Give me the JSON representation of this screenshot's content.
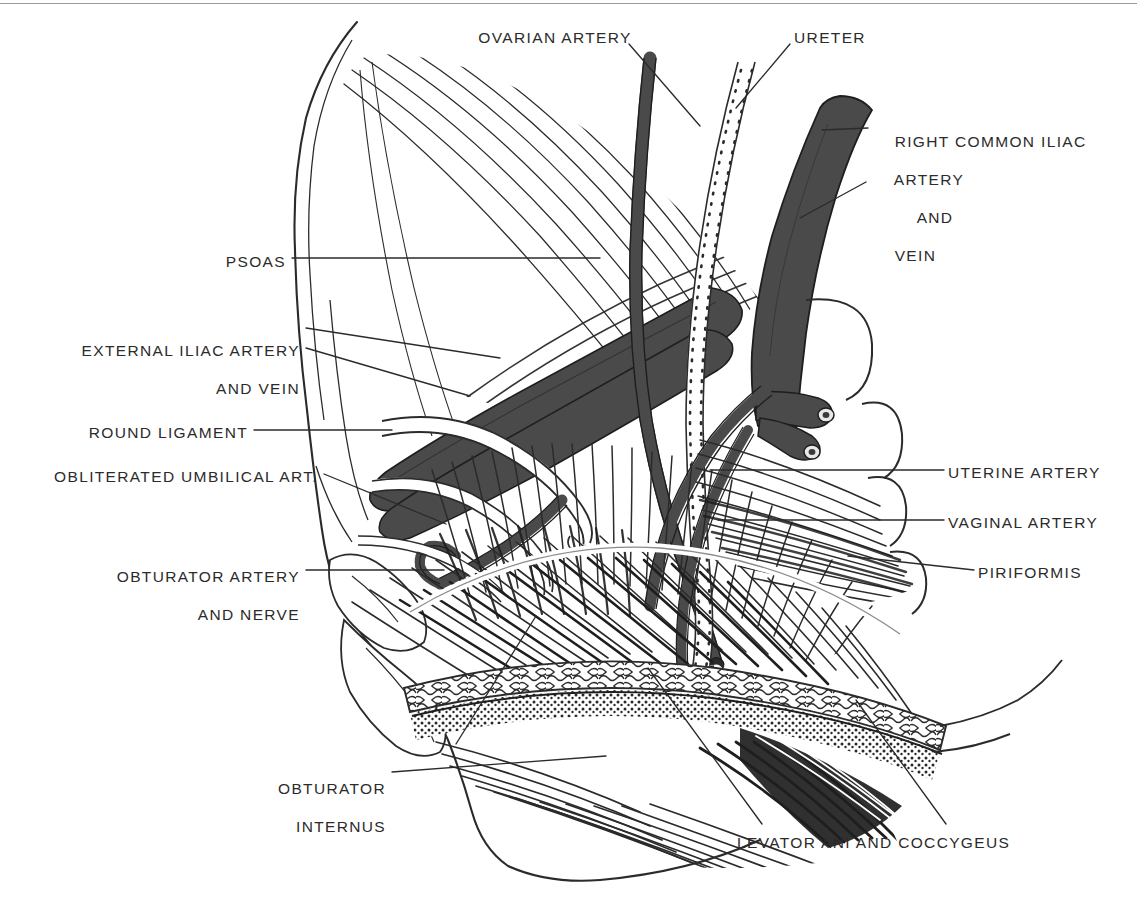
{
  "figure": {
    "background_color": "#ffffff",
    "ink_color": "#2b2b2b",
    "vessel_fill": "#4a4a4a",
    "vessel_fill_dark": "#3a3a3a",
    "ureter_fill": "#ffffff",
    "top_rule_color": "#9a9a9a"
  },
  "labels": [
    {
      "id": "ovarian-artery",
      "text": "OVARIAN ARTERY",
      "align": "c",
      "x": 555,
      "y": 28,
      "lines": [
        "OVARIAN ARTERY"
      ]
    },
    {
      "id": "ureter",
      "text": "URETER",
      "align": "c",
      "x": 830,
      "y": 28,
      "lines": [
        "URETER"
      ]
    },
    {
      "id": "right-common-iliac-artery-and-vein",
      "text": "RIGHT COMMON ILIAC ARTERY AND VEIN",
      "align": "l",
      "x": 872,
      "y": 113,
      "lines": [
        "RIGHT COMMON ILIAC",
        "ARTERY",
        "AND",
        "VEIN"
      ]
    },
    {
      "id": "psoas",
      "text": "PSOAS",
      "align": "r",
      "x": 286,
      "y": 252,
      "lines": [
        "PSOAS"
      ]
    },
    {
      "id": "external-iliac-artery-and-vein",
      "text": "EXTERNAL ILIAC ARTERY AND VEIN",
      "align": "r",
      "x": 300,
      "y": 322,
      "lines": [
        "EXTERNAL ILIAC ARTERY",
        "AND VEIN"
      ]
    },
    {
      "id": "round-ligament",
      "text": "ROUND LIGAMENT",
      "align": "r",
      "x": 248,
      "y": 423,
      "lines": [
        "ROUND LIGAMENT"
      ]
    },
    {
      "id": "obliterated-umbilical-artery",
      "text": "OBLITERATED UMBILICAL ART.",
      "align": "r",
      "x": 318,
      "y": 467,
      "lines": [
        "OBLITERATED UMBILICAL ART."
      ]
    },
    {
      "id": "obturator-artery-and-nerve",
      "text": "OBTURATOR ARTERY AND NERVE",
      "align": "r",
      "x": 300,
      "y": 548,
      "lines": [
        "OBTURATOR ARTERY",
        "AND NERVE"
      ]
    },
    {
      "id": "uterine-artery",
      "text": "UTERINE ARTERY",
      "align": "l",
      "x": 948,
      "y": 463,
      "lines": [
        "UTERINE ARTERY"
      ]
    },
    {
      "id": "vaginal-artery",
      "text": "VAGINAL ARTERY",
      "align": "l",
      "x": 948,
      "y": 513,
      "lines": [
        "VAGINAL ARTERY"
      ]
    },
    {
      "id": "piriformis",
      "text": "PIRIFORMIS",
      "align": "l",
      "x": 978,
      "y": 563,
      "lines": [
        "PIRIFORMIS"
      ]
    },
    {
      "id": "obturator-internus",
      "text": "OBTURATOR INTERNUS",
      "align": "r",
      "x": 386,
      "y": 760,
      "lines": [
        "OBTURATOR",
        "INTERNUS"
      ]
    },
    {
      "id": "levator-ani-and-coccygeus",
      "text": "LEVATOR ANI AND COCCYGEUS",
      "align": "l",
      "x": 737,
      "y": 833,
      "lines": [
        "LEVATOR ANI AND COCCYGEUS"
      ]
    }
  ],
  "structures": [
    {
      "id": "psoas-muscle",
      "name": "Psoas major muscle"
    },
    {
      "id": "iliac-bone",
      "name": "Iliac bone / pelvic side wall"
    },
    {
      "id": "ovarian-artery-vessel",
      "name": "Ovarian artery"
    },
    {
      "id": "ureter-vessel",
      "name": "Ureter"
    },
    {
      "id": "common-iliac-vessel",
      "name": "Right common iliac artery and vein"
    },
    {
      "id": "external-iliac-vessel",
      "name": "External iliac artery and vein"
    },
    {
      "id": "round-ligament-structure",
      "name": "Round ligament"
    },
    {
      "id": "obliterated-umbilical-artery-vessel",
      "name": "Obliterated umbilical artery"
    },
    {
      "id": "obturator-vessel",
      "name": "Obturator artery and nerve"
    },
    {
      "id": "uterine-artery-vessel",
      "name": "Uterine artery"
    },
    {
      "id": "vaginal-artery-vessel",
      "name": "Vaginal artery"
    },
    {
      "id": "piriformis-muscle",
      "name": "Piriformis muscle"
    },
    {
      "id": "obturator-internus-muscle",
      "name": "Obturator internus muscle"
    },
    {
      "id": "levator-ani-muscle",
      "name": "Levator ani and coccygeus muscle"
    },
    {
      "id": "tendinous-arch",
      "name": "Tendinous arch (arcus tendineus)"
    },
    {
      "id": "sacral-foramina",
      "name": "Sacral foramina arcs"
    }
  ]
}
